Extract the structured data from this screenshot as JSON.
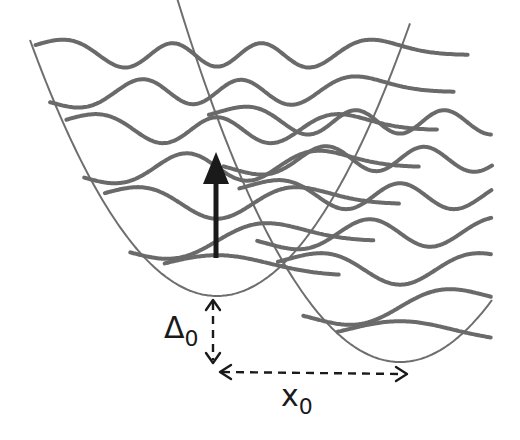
{
  "figure": {
    "colors": {
      "curve": "#6a6a6a",
      "arrow": "#1a1a1a",
      "background": "#ffffff"
    },
    "wells": [
      {
        "name": "ground-state-well",
        "vertex": [
          217,
          296
        ],
        "curvature": 0.00732,
        "levels_y": [
          55,
          92,
          130,
          167,
          204,
          241,
          276
        ]
      },
      {
        "name": "excited-state-well",
        "vertex": [
          400,
          362
        ],
        "curvature": 0.00732,
        "levels_y": [
          122,
          159,
          196,
          233,
          270,
          307,
          342
        ]
      }
    ],
    "excitation_arrow": {
      "from": [
        215,
        258
      ],
      "to": [
        215,
        160
      ]
    },
    "labels": {
      "delta": {
        "symbol": "Δ",
        "subscript": "0"
      },
      "displacement": {
        "symbol": "x",
        "subscript": "0"
      }
    }
  }
}
